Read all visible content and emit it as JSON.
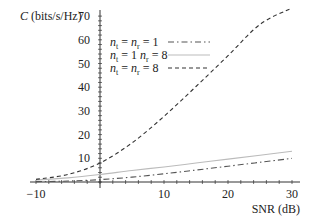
{
  "chart_data": {
    "type": "line",
    "title": "",
    "xlabel": "SNR (dB)",
    "ylabel": "C (bits/s/Hz)",
    "xlim": [
      -10,
      30
    ],
    "ylim": [
      0,
      70
    ],
    "xticks": [
      -10,
      10,
      20,
      30
    ],
    "yticks": [
      10,
      20,
      30,
      40,
      50,
      60,
      70
    ],
    "grid": false,
    "legend_position": "upper-left-inside",
    "x": [
      -10,
      -5,
      0,
      5,
      10,
      15,
      20,
      25,
      30
    ],
    "series": [
      {
        "name": "n_t = n_r = 1",
        "style": "dash-dot",
        "color": "#555555",
        "values": [
          0.14,
          0.4,
          1.0,
          2.06,
          3.46,
          5.04,
          6.66,
          8.31,
          9.97
        ]
      },
      {
        "name": "n_t = 1 n_r = 8",
        "style": "solid",
        "color": "#bbbbbb",
        "values": [
          0.82,
          1.76,
          3.17,
          4.85,
          6.35,
          8.0,
          9.64,
          11.3,
          12.97
        ]
      },
      {
        "name": "n_t = n_r = 8",
        "style": "dashed",
        "color": "#333333",
        "values": [
          1.1,
          3.2,
          8.0,
          16.5,
          27.7,
          40.3,
          53.3,
          66.5,
          79.7
        ]
      }
    ]
  },
  "legend": {
    "items": [
      {
        "sub_t": "t",
        "sub_r": "r",
        "text_a": "n",
        "eq1": " = ",
        "text_b": "n",
        "eq2": " = 1",
        "style": "dash-dot"
      },
      {
        "sub_t": "t",
        "sub_r": "r",
        "text_a": "n",
        "eq1": " = 1 ",
        "text_b": "n",
        "eq2": " = 8",
        "style": "solid"
      },
      {
        "sub_t": "t",
        "sub_r": "r",
        "text_a": "n",
        "eq1": " = ",
        "text_b": "n",
        "eq2": " = 8",
        "style": "dashed"
      }
    ]
  },
  "axes": {
    "y_title_main": "C",
    "y_title_units": " (bits/s/Hz)",
    "x_title": "SNR (dB)",
    "x_tick_labels": [
      "−10",
      "10",
      "20",
      "30"
    ],
    "y_tick_labels": [
      "10",
      "20",
      "30",
      "40",
      "50",
      "60",
      "70"
    ]
  }
}
